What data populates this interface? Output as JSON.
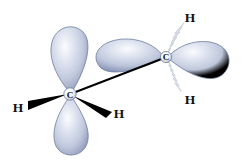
{
  "figure": {
    "background_color": "#ffffff",
    "width": 246,
    "height": 165
  },
  "palette": {
    "lobe_highlight": "#f4f6fb",
    "lobe_mid": "#c3cbe2",
    "lobe_edge": "#7c88ab",
    "lobe_outline": "#6f7b9e",
    "bond_solid": "#000000",
    "bond_hashed": "#b9bfcf",
    "label_color": "#111111",
    "carbon_core_fill": "#ffffff",
    "carbon_core_stroke": "#5f6b8c"
  },
  "atoms": [
    {
      "id": "carbon-left",
      "element": "C",
      "label": "C",
      "x": 70,
      "y": 94
    },
    {
      "id": "carbon-right",
      "element": "C",
      "label": "C",
      "x": 166,
      "y": 57
    },
    {
      "id": "hydrogen-left",
      "element": "H",
      "label": "H",
      "x": 18,
      "y": 107,
      "bond_style": "solid-wedge"
    },
    {
      "id": "hydrogen-bottom-right",
      "element": "H",
      "label": "H",
      "x": 119,
      "y": 113,
      "bond_style": "solid-wedge"
    },
    {
      "id": "hydrogen-top-right",
      "element": "H",
      "label": "H",
      "x": 190,
      "y": 17,
      "bond_style": "hashed-wedge"
    },
    {
      "id": "hydrogen-lower-right",
      "element": "H",
      "label": "H",
      "x": 190,
      "y": 99,
      "bond_style": "hashed-wedge"
    }
  ],
  "bonds": [
    {
      "id": "bond-c-c",
      "from": "carbon-left",
      "to": "carbon-right",
      "style": "solid-line"
    },
    {
      "id": "bond-c-left-h-left",
      "from": "carbon-left",
      "to": "hydrogen-left",
      "style": "solid-wedge"
    },
    {
      "id": "bond-c-left-h-bottom-right",
      "from": "carbon-left",
      "to": "hydrogen-bottom-right",
      "style": "solid-wedge"
    },
    {
      "id": "bond-c-right-h-top",
      "from": "carbon-right",
      "to": "hydrogen-top-right",
      "style": "hashed-wedge"
    },
    {
      "id": "bond-c-right-h-lower",
      "from": "carbon-right",
      "to": "hydrogen-lower-right",
      "style": "hashed-wedge"
    }
  ],
  "orbitals": [
    {
      "id": "lobe-left-up",
      "atom": "carbon-left",
      "direction": "up"
    },
    {
      "id": "lobe-left-down",
      "atom": "carbon-left",
      "direction": "down"
    },
    {
      "id": "lobe-right-left",
      "atom": "carbon-right",
      "direction": "left"
    },
    {
      "id": "lobe-right-right",
      "atom": "carbon-right",
      "direction": "right"
    }
  ]
}
